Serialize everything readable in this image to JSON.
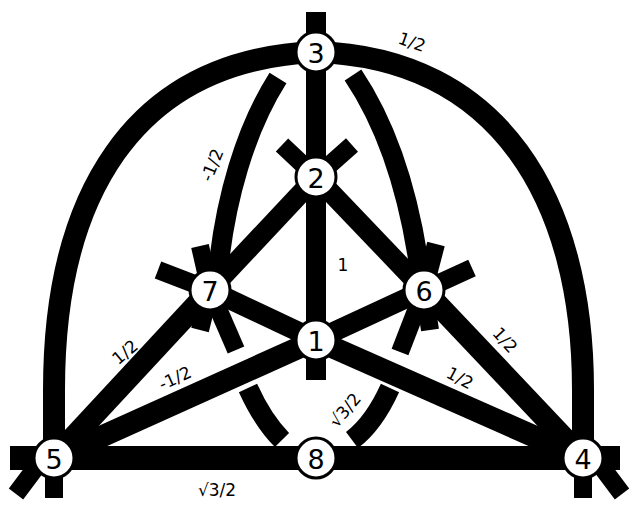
{
  "diagram": {
    "title": "",
    "colors": {
      "stroke": "#000000",
      "background": "#ffffff",
      "node_fill": "#ffffff"
    },
    "nodes": [
      {
        "id": "1",
        "label": "1",
        "x": 316,
        "y": 340
      },
      {
        "id": "2",
        "label": "2",
        "x": 316,
        "y": 177
      },
      {
        "id": "3",
        "label": "3",
        "x": 316,
        "y": 52
      },
      {
        "id": "4",
        "label": "4",
        "x": 583,
        "y": 458
      },
      {
        "id": "5",
        "label": "5",
        "x": 54,
        "y": 458
      },
      {
        "id": "6",
        "label": "6",
        "x": 424,
        "y": 290
      },
      {
        "id": "7",
        "label": "7",
        "x": 210,
        "y": 290
      },
      {
        "id": "8",
        "label": "8",
        "x": 316,
        "y": 458
      }
    ],
    "edges": [
      {
        "from": "5",
        "to": "8",
        "label": "",
        "shape": "line"
      },
      {
        "from": "8",
        "to": "4",
        "label": "",
        "shape": "line"
      },
      {
        "from": "3",
        "to": "1",
        "label": "1",
        "shape": "line"
      },
      {
        "from": "2",
        "to": "7",
        "label": "",
        "shape": "line"
      },
      {
        "from": "2",
        "to": "6",
        "label": "",
        "shape": "line"
      },
      {
        "from": "7",
        "to": "1",
        "label": "",
        "shape": "line"
      },
      {
        "from": "6",
        "to": "1",
        "label": "",
        "shape": "line"
      },
      {
        "from": "5",
        "to": "7",
        "label": "1/2",
        "shape": "line"
      },
      {
        "from": "5",
        "to": "1",
        "label": "-1/2",
        "shape": "line"
      },
      {
        "from": "1",
        "to": "4",
        "label": "1/2",
        "shape": "line"
      },
      {
        "from": "6",
        "to": "4",
        "label": "1/2",
        "shape": "line"
      },
      {
        "from": "5",
        "to": "3",
        "label": "",
        "shape": "arc"
      },
      {
        "from": "3",
        "to": "4",
        "label": "1/2",
        "shape": "arc"
      },
      {
        "from": "3",
        "to": "7",
        "label": "-1/2",
        "shape": "inner-arc"
      },
      {
        "from": "3",
        "to": "6",
        "label": "",
        "shape": "inner-arc"
      },
      {
        "from": "7",
        "to": "8",
        "label": "√3/2",
        "shape": "inner-arc"
      }
    ],
    "edge_labels": [
      {
        "text": "1/2",
        "x": 412,
        "y": 42,
        "rotate": 20
      },
      {
        "text": "-1/2",
        "x": 212,
        "y": 165,
        "rotate": -68
      },
      {
        "text": "1",
        "x": 343,
        "y": 265,
        "rotate": 0
      },
      {
        "text": "1/2",
        "x": 125,
        "y": 352,
        "rotate": -40
      },
      {
        "text": "-1/2",
        "x": 175,
        "y": 378,
        "rotate": -25
      },
      {
        "text": "1/2",
        "x": 505,
        "y": 340,
        "rotate": 48
      },
      {
        "text": "1/2",
        "x": 460,
        "y": 378,
        "rotate": 28
      },
      {
        "text": "√3/2",
        "x": 345,
        "y": 410,
        "rotate": -50
      },
      {
        "text": "√3/2",
        "x": 217,
        "y": 490,
        "rotate": 0
      }
    ]
  }
}
